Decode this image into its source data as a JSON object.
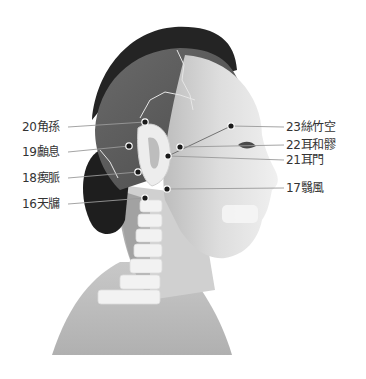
{
  "figure": {
    "title": "",
    "colors": {
      "hair": "#222222",
      "scalp": "#5a5a5a",
      "skin": "#d9d9d9",
      "skin_light": "#ececec",
      "neck_shadow": "#8a8a8a",
      "spine": "#f2f2f2",
      "dot": "#1a1a1a",
      "leader": "#9a9a9a",
      "suture": "#e8e8e8"
    },
    "points": [
      {
        "id": "20",
        "label": "20角孫",
        "side": "left",
        "x": 145,
        "y": 122,
        "lx": 22,
        "ly": 120
      },
      {
        "id": "19",
        "label": "19顱息",
        "side": "left",
        "x": 129,
        "y": 146,
        "lx": 22,
        "ly": 145
      },
      {
        "id": "18",
        "label": "18瘈脈",
        "side": "left",
        "x": 138,
        "y": 172,
        "lx": 22,
        "ly": 171
      },
      {
        "id": "16",
        "label": "16天牖",
        "side": "left",
        "x": 145,
        "y": 198,
        "lx": 22,
        "ly": 197
      },
      {
        "id": "23",
        "label": "23絲竹空",
        "side": "right",
        "x": 231,
        "y": 126,
        "lx": 286,
        "ly": 121
      },
      {
        "id": "22",
        "label": "22耳和髎",
        "side": "right",
        "x": 180,
        "y": 147,
        "lx": 286,
        "ly": 138
      },
      {
        "id": "21",
        "label": "21耳門",
        "side": "right",
        "x": 168,
        "y": 156,
        "lx": 286,
        "ly": 154
      },
      {
        "id": "17",
        "label": "17翳風",
        "side": "right",
        "x": 167,
        "y": 189,
        "lx": 286,
        "ly": 182
      }
    ]
  },
  "labels": {
    "p20": "20角孫",
    "p19": "19顱息",
    "p18": "18瘈脈",
    "p16": "16天牖",
    "p23": "23絲竹空",
    "p22": "22耳和髎",
    "p21": "21耳門",
    "p17": "17翳風"
  }
}
